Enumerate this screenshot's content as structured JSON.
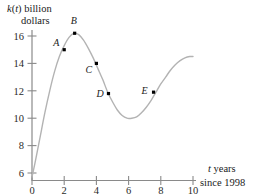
{
  "figure": {
    "name": "graph-of-k-of-t",
    "yaxis_label_line1": "k(t) billion",
    "yaxis_label_line2": "dollars",
    "yaxis_label_var": "k",
    "yaxis_label_paren_open": "(",
    "yaxis_label_inner_var": "t",
    "yaxis_label_paren_close": ")",
    "yaxis_label_units": " billion",
    "xaxis_label_var": "t",
    "xaxis_label_rest": " years",
    "xaxis_label_line2": "since 1998",
    "curve_color": "#b3b3b3",
    "axis_color": "#8a8a8a",
    "point_color": "#000000",
    "text_color": "#1a1a1a"
  },
  "chart_data": {
    "type": "line",
    "title": "",
    "xlabel": "t years since 1998",
    "ylabel": "k(t) billion dollars",
    "xlim": [
      0,
      10
    ],
    "ylim": [
      5,
      17
    ],
    "xticks": [
      0,
      2,
      4,
      6,
      8,
      10
    ],
    "xtick_labels": [
      "0",
      "2",
      "4",
      "6",
      "8",
      "10"
    ],
    "yticks": [
      6,
      8,
      10,
      12,
      14,
      16
    ],
    "ytick_labels": [
      "6",
      "8",
      "10",
      "12",
      "14",
      "16"
    ],
    "grid": false,
    "legend": null,
    "series": [
      {
        "name": "k(t)",
        "x": [
          0.0,
          0.25,
          0.5,
          0.8,
          1.1,
          1.4,
          1.7,
          2.0,
          2.3,
          2.6,
          2.9,
          3.2,
          3.5,
          3.8,
          4.1,
          4.4,
          4.7,
          5.0,
          5.3,
          5.6,
          5.9,
          6.2,
          6.5,
          6.8,
          7.1,
          7.4,
          7.7,
          8.0,
          8.3,
          8.6,
          8.9,
          9.2,
          9.5,
          9.8,
          10.0
        ],
        "y": [
          5.7,
          7.1,
          8.6,
          10.4,
          12.0,
          13.4,
          14.5,
          15.3,
          15.9,
          16.2,
          16.1,
          15.7,
          15.1,
          14.4,
          13.6,
          12.8,
          11.9,
          11.2,
          10.6,
          10.2,
          10.0,
          10.0,
          10.1,
          10.4,
          10.8,
          11.3,
          11.9,
          12.5,
          13.0,
          13.5,
          13.9,
          14.2,
          14.4,
          14.5,
          14.5
        ]
      }
    ],
    "annotations": [
      {
        "label": "A",
        "x": 2.0,
        "y": 15.0,
        "label_dx": -11,
        "label_dy": -4
      },
      {
        "label": "B",
        "x": 2.65,
        "y": 16.2,
        "label_dx": -4,
        "label_dy": -9
      },
      {
        "label": "C",
        "x": 4.0,
        "y": 14.0,
        "label_dx": -11,
        "label_dy": 10
      },
      {
        "label": "D",
        "x": 4.75,
        "y": 11.8,
        "label_dx": -12,
        "label_dy": 3
      },
      {
        "label": "E",
        "x": 7.55,
        "y": 11.9,
        "label_dx": -12,
        "label_dy": 2
      }
    ]
  }
}
